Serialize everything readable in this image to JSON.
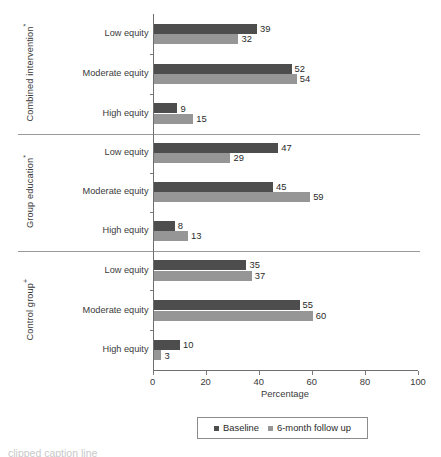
{
  "chart_data": {
    "type": "bar",
    "orientation": "horizontal",
    "title": "",
    "xlabel": "Percentage",
    "ylabel": "",
    "xlim": [
      0,
      100
    ],
    "xticks": [
      0,
      20,
      40,
      60,
      80,
      100
    ],
    "xtick_labels": [
      "0",
      "20",
      "40",
      "60",
      "80",
      "100"
    ],
    "grid": false,
    "legend_position": "bottom",
    "categories": [
      "Low equity",
      "Moderate equity",
      "High equity"
    ],
    "legend_entries": [
      "Baseline",
      "6-month follow up"
    ],
    "series": [
      {
        "name": "Baseline",
        "color": "#4d4d4d"
      },
      {
        "name": "6-month follow up",
        "color": "#969696"
      }
    ],
    "panels": [
      {
        "label": "Combined intervention",
        "marker": "*",
        "groups": [
          {
            "category": "Low equity",
            "baseline": 39,
            "followup": 32
          },
          {
            "category": "Moderate equity",
            "baseline": 52,
            "followup": 54
          },
          {
            "category": "High equity",
            "baseline": 9,
            "followup": 15
          }
        ]
      },
      {
        "label": "Group education",
        "marker": "*",
        "groups": [
          {
            "category": "Low equity",
            "baseline": 47,
            "followup": 29
          },
          {
            "category": "Moderate equity",
            "baseline": 45,
            "followup": 59
          },
          {
            "category": "High equity",
            "baseline": 8,
            "followup": 13
          }
        ]
      },
      {
        "label": "Control group",
        "marker": "+",
        "groups": [
          {
            "category": "Low equity",
            "baseline": 35,
            "followup": 37
          },
          {
            "category": "Moderate equity",
            "baseline": 55,
            "followup": 60
          },
          {
            "category": "High equity",
            "baseline": 10,
            "followup": 3
          }
        ]
      }
    ]
  },
  "caption": {
    "text": "clipped caption line"
  }
}
